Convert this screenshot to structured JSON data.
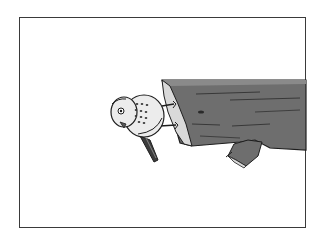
{
  "image": {
    "description": "Line illustration of a small bird perched on a fallen log, rotated sideways, inside a thin rectangular frame",
    "subject": "bird on log",
    "colors": {
      "frame_border": "#3a3a3a",
      "background": "#ffffff",
      "log_fill": "#6e6e6e",
      "log_end": "#d9d9d9",
      "bird_body": "#ececec",
      "bird_tail": "#3c3c3c",
      "outline": "#1e1e1e"
    }
  }
}
